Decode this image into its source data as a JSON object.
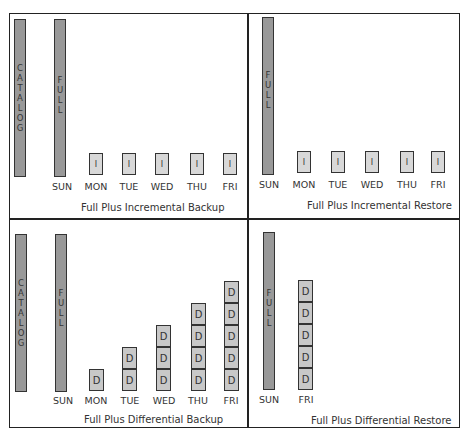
{
  "colors": {
    "full_bar": "#999999",
    "incremental_box": "#d8d8d8",
    "differential_box": "#c8c8c8",
    "border": "#222222"
  },
  "panels": {
    "inc_backup": {
      "caption": "Full Plus Incremental Backup",
      "catalog_label": [
        "C",
        "A",
        "T",
        "A",
        "L",
        "O",
        "G"
      ],
      "full_label": [
        "F",
        "U",
        "L",
        "L"
      ],
      "days": [
        "SUN",
        "MON",
        "TUE",
        "WED",
        "THU",
        "FRI"
      ],
      "box_label": "I"
    },
    "inc_restore": {
      "caption": "Full Plus Incremental Restore",
      "full_label": [
        "F",
        "U",
        "L",
        "L"
      ],
      "days": [
        "SUN",
        "MON",
        "TUE",
        "WED",
        "THU",
        "FRI"
      ],
      "box_label": "I"
    },
    "diff_backup": {
      "caption": "Full Plus Differential Backup",
      "catalog_label": [
        "C",
        "A",
        "T",
        "A",
        "L",
        "O",
        "G"
      ],
      "full_label": [
        "F",
        "U",
        "L",
        "L"
      ],
      "days": [
        "SUN",
        "MON",
        "TUE",
        "WED",
        "THU",
        "FRI"
      ],
      "box_label": "D",
      "stack_counts": [
        1,
        2,
        3,
        4,
        5
      ]
    },
    "diff_restore": {
      "caption": "Full Plus Differential Restore",
      "full_label": [
        "F",
        "U",
        "L",
        "L"
      ],
      "days": [
        "SUN",
        "FRI"
      ],
      "box_label": "D",
      "stack_counts": [
        5
      ]
    }
  }
}
